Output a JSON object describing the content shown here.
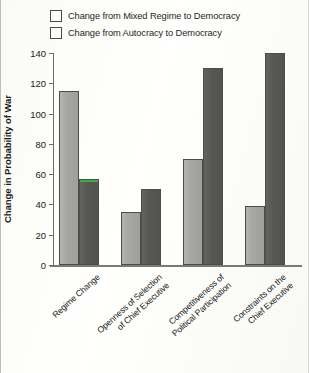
{
  "chart_data": {
    "type": "bar",
    "title": "",
    "xlabel": "",
    "ylabel": "Change in Probability of War",
    "ylim": [
      0,
      140
    ],
    "yticks": [
      0,
      20,
      40,
      60,
      80,
      100,
      120,
      140
    ],
    "grid": false,
    "legend_position": "top-left",
    "categories": [
      "Regime Change",
      "Openness of Selection of Chief Executive",
      "Competitiveness of Political Participation",
      "Constraints on the Chief Executive"
    ],
    "category_lines": [
      [
        "Regime Change"
      ],
      [
        "Openness of Selection",
        "of Chief Executive"
      ],
      [
        "Competitiveness of",
        "Political Participation"
      ],
      [
        "Constraints on the",
        "Chief Executive"
      ]
    ],
    "series": [
      {
        "name": "Change from Mixed Regime to Democracy",
        "color": "#a6a6a3",
        "values": [
          115,
          35,
          70,
          39
        ]
      },
      {
        "name": "Change from Autocracy to Democracy",
        "color": "#575754",
        "values": [
          57,
          50,
          130,
          140
        ]
      }
    ],
    "annotations": [
      {
        "type": "highlight-line",
        "color": "#3fae3f",
        "series": "Change from Autocracy to Democracy",
        "category": "Regime Change",
        "value": 57
      }
    ]
  }
}
